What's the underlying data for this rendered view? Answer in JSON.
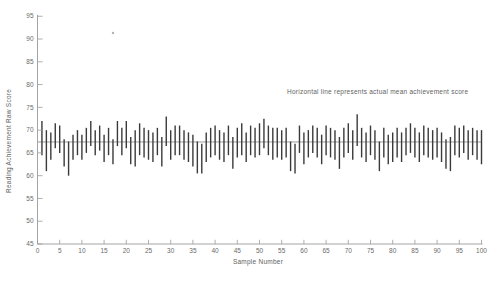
{
  "chart_data": {
    "type": "bar",
    "subtype": "vertical-interval-segments",
    "title": "",
    "xlabel": "Sample Number",
    "ylabel": "Reading Achievement Raw Score",
    "annotation": "Horizontal line represents actual mean achievement score",
    "xlim": [
      0,
      100
    ],
    "ylim": [
      45,
      95
    ],
    "xticks": [
      0,
      5,
      10,
      15,
      20,
      25,
      30,
      35,
      40,
      45,
      50,
      55,
      60,
      65,
      70,
      75,
      80,
      85,
      90,
      95,
      100
    ],
    "yticks": [
      45,
      50,
      55,
      60,
      65,
      70,
      75,
      80,
      85,
      90,
      95
    ],
    "grid": false,
    "legend": false,
    "mean_line_value": 67.4,
    "first_sample_number": 1,
    "intervals": [
      [
        64.5,
        72.0
      ],
      [
        61.0,
        70.0
      ],
      [
        63.5,
        69.5
      ],
      [
        66.0,
        71.5
      ],
      [
        65.0,
        71.0
      ],
      [
        62.0,
        68.0
      ],
      [
        60.0,
        67.5
      ],
      [
        63.5,
        69.0
      ],
      [
        64.5,
        70.0
      ],
      [
        63.5,
        69.0
      ],
      [
        65.0,
        70.5
      ],
      [
        66.5,
        72.0
      ],
      [
        64.5,
        70.0
      ],
      [
        65.5,
        71.0
      ],
      [
        63.0,
        69.0
      ],
      [
        64.5,
        70.5
      ],
      [
        62.5,
        68.0
      ],
      [
        66.5,
        72.0
      ],
      [
        64.5,
        70.5
      ],
      [
        66.0,
        72.0
      ],
      [
        62.5,
        68.5
      ],
      [
        62.0,
        70.0
      ],
      [
        64.5,
        71.5
      ],
      [
        64.0,
        70.5
      ],
      [
        63.5,
        70.0
      ],
      [
        63.0,
        69.5
      ],
      [
        64.5,
        70.5
      ],
      [
        62.0,
        68.5
      ],
      [
        66.5,
        73.0
      ],
      [
        63.5,
        70.0
      ],
      [
        64.5,
        71.0
      ],
      [
        64.5,
        71.0
      ],
      [
        63.5,
        70.0
      ],
      [
        63.0,
        69.5
      ],
      [
        62.0,
        69.0
      ],
      [
        60.5,
        67.5
      ],
      [
        60.5,
        67.0
      ],
      [
        63.0,
        69.5
      ],
      [
        64.0,
        70.5
      ],
      [
        64.5,
        71.0
      ],
      [
        63.5,
        70.0
      ],
      [
        63.0,
        69.5
      ],
      [
        64.5,
        71.0
      ],
      [
        61.5,
        68.5
      ],
      [
        64.0,
        70.5
      ],
      [
        64.5,
        71.5
      ],
      [
        63.0,
        69.5
      ],
      [
        64.5,
        71.0
      ],
      [
        64.0,
        70.5
      ],
      [
        64.5,
        71.5
      ],
      [
        66.0,
        72.5
      ],
      [
        64.5,
        71.0
      ],
      [
        63.5,
        70.5
      ],
      [
        64.0,
        70.5
      ],
      [
        63.5,
        70.0
      ],
      [
        64.0,
        70.5
      ],
      [
        61.0,
        67.5
      ],
      [
        60.5,
        67.0
      ],
      [
        65.0,
        71.0
      ],
      [
        62.5,
        69.5
      ],
      [
        64.0,
        70.0
      ],
      [
        65.0,
        71.0
      ],
      [
        64.0,
        70.5
      ],
      [
        62.5,
        69.0
      ],
      [
        64.5,
        71.0
      ],
      [
        64.0,
        70.5
      ],
      [
        63.5,
        70.0
      ],
      [
        61.5,
        68.5
      ],
      [
        64.0,
        70.5
      ],
      [
        65.0,
        71.5
      ],
      [
        63.5,
        70.0
      ],
      [
        66.5,
        73.5
      ],
      [
        64.0,
        70.5
      ],
      [
        63.0,
        69.5
      ],
      [
        64.5,
        71.0
      ],
      [
        63.5,
        70.0
      ],
      [
        61.0,
        67.5
      ],
      [
        64.0,
        70.5
      ],
      [
        62.5,
        69.0
      ],
      [
        63.0,
        69.5
      ],
      [
        64.0,
        70.5
      ],
      [
        63.0,
        69.5
      ],
      [
        64.5,
        70.5
      ],
      [
        65.0,
        71.5
      ],
      [
        64.0,
        70.5
      ],
      [
        63.0,
        69.5
      ],
      [
        64.5,
        71.0
      ],
      [
        64.0,
        70.5
      ],
      [
        63.5,
        70.0
      ],
      [
        64.0,
        70.5
      ],
      [
        63.0,
        69.5
      ],
      [
        61.5,
        68.0
      ],
      [
        61.0,
        68.5
      ],
      [
        64.5,
        71.0
      ],
      [
        64.0,
        70.5
      ],
      [
        65.0,
        71.0
      ],
      [
        63.5,
        70.0
      ],
      [
        64.5,
        70.5
      ],
      [
        63.5,
        70.0
      ],
      [
        62.5,
        70.0
      ]
    ]
  },
  "colors": {
    "background": "#ffffff",
    "bar_ink": "#3a3a3a",
    "axis_line": "#9a9a9a",
    "tick_text": "#6a6a6a",
    "label_text": "#5f5f5f",
    "mean_line": "#8f8f8f",
    "artifact": "#8a8a8a"
  },
  "artifacts": {
    "speck": {
      "x": 113,
      "y": 33
    }
  }
}
